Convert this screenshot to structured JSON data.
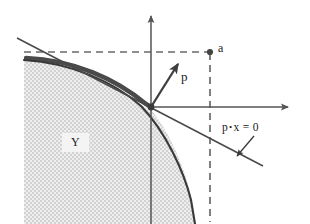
{
  "figure": {
    "background_color": "#ffffff",
    "width": 310,
    "height": 224
  },
  "axes": {
    "vertical": {
      "name": "vertical-axis",
      "color": "#555555",
      "x": 151,
      "y_top": 12,
      "y_bottom": 224,
      "arrow": "up"
    },
    "horizontal": {
      "name": "horizontal-axis",
      "color": "#555555",
      "y": 107,
      "x_left": 151,
      "x_right": 292,
      "arrow": "right"
    }
  },
  "region": {
    "label": "Y",
    "fill_pattern": "checkered-stipple",
    "fill_color": "#d4d4d4",
    "description": "production set"
  },
  "frontier": {
    "name": "production-frontier",
    "color": "#333333",
    "description": "concave boundary curve of Y"
  },
  "crescent": {
    "name": "crescent-band",
    "color": "#4a4a4a",
    "description": "dark band between the dashed level line and the frontier"
  },
  "point_a": {
    "label": "a",
    "x": 210,
    "y": 52,
    "marker_color": "#444444"
  },
  "dashed_lines": {
    "color": "#666666",
    "horizontal": {
      "name": "dashed-horizontal-line",
      "y": 52,
      "x_left": 24,
      "x_right": 210
    },
    "vertical": {
      "name": "dashed-vertical-line",
      "x": 210,
      "y_top": 52,
      "y_bottom": 222
    }
  },
  "vector_p": {
    "label": "p",
    "color": "#444444",
    "origin_x": 151,
    "origin_y": 107,
    "tip_x": 180,
    "tip_y": 61
  },
  "hyperplane": {
    "label_parts": {
      "p": "p",
      "dot": "•",
      "rest": "x = 0"
    },
    "label_text": "p •x = 0",
    "color": "#4a4a4a",
    "description": "supporting hyperplane through the tangency point"
  },
  "tangency_point": {
    "x": 151,
    "y": 107
  },
  "pointer_arrow": {
    "name": "callout-pointer-arrow",
    "from_x": 253,
    "from_y": 137,
    "to_x": 236,
    "to_y": 157,
    "color": "#3a3a3a"
  }
}
